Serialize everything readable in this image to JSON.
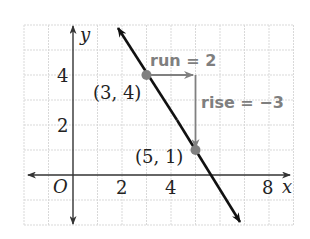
{
  "graph": {
    "grid": {
      "x_min": -2,
      "x_max": 9,
      "y_min": -2,
      "y_max": 6,
      "color": "#d9d9d9"
    },
    "axes": {
      "x_label": "x",
      "y_label": "y",
      "origin_label": "O",
      "x_ticks": [
        "2",
        "4",
        "8"
      ],
      "y_ticks": [
        "4",
        "2"
      ],
      "color": "#333333"
    },
    "line": {
      "color": "#111111",
      "slope": "-3/2"
    },
    "points": [
      {
        "label": "(3, 4)",
        "x": 3,
        "y": 4,
        "color": "#808080"
      },
      {
        "label": "(5, 1)",
        "x": 5,
        "y": 1,
        "color": "#808080"
      }
    ],
    "run": {
      "label": "run = 2",
      "color": "#7f7f7f"
    },
    "rise": {
      "label": "rise = −3",
      "color": "#7f7f7f"
    }
  }
}
